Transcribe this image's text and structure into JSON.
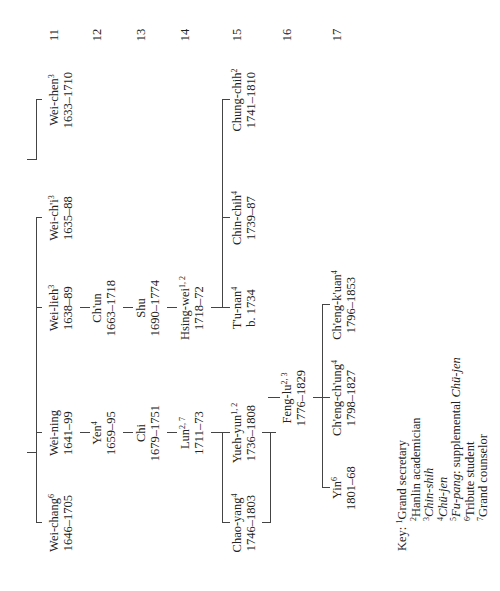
{
  "generations": [
    "11",
    "12",
    "13",
    "14",
    "15",
    "16",
    "17"
  ],
  "people": {
    "wei_chen": {
      "name": "Wei-chen",
      "sup": "3",
      "dates": "1633–1710"
    },
    "wei_chang": {
      "name": "Wei-chang",
      "sup": "6",
      "dates": "1646–1705"
    },
    "wei_ning": {
      "name": "Wei-ning",
      "sup": "",
      "dates": "1641–99"
    },
    "wei_lieh": {
      "name": "Wei-lieh",
      "sup": "3",
      "dates": "1638–89"
    },
    "wei_chi": {
      "name": "Wei-ch'i",
      "sup": "3",
      "dates": "1635–88"
    },
    "yen": {
      "name": "Yen",
      "sup": "4",
      "dates": "1659–95"
    },
    "chun": {
      "name": "Ch'un",
      "sup": "",
      "dates": "1663–1718"
    },
    "chi": {
      "name": "Chi",
      "sup": "",
      "dates": "1679–1751"
    },
    "shu": {
      "name": "Shu",
      "sup": "",
      "dates": "1690–1774"
    },
    "lun": {
      "name": "Lun",
      "sup": "2, 7",
      "dates": "1711–73"
    },
    "hsing_wei": {
      "name": "Hsing-wei",
      "sup": "1, 2",
      "dates": "1718–72"
    },
    "chao_yang": {
      "name": "Chao-yang",
      "sup": "4",
      "dates": "1746–1803"
    },
    "yueh_yun": {
      "name": "Yueh-yun",
      "sup": "1, 2",
      "dates": "1736–1808"
    },
    "tu_nan": {
      "name": "T'u-nan",
      "sup": "4",
      "dates": "b. 1734"
    },
    "chin_chih": {
      "name": "Chin-chih",
      "sup": "4",
      "dates": "1739–87"
    },
    "chung_chih": {
      "name": "Chung-chih",
      "sup": "2",
      "dates": "1741–1810"
    },
    "feng_lu": {
      "name": "Feng-lu",
      "sup": "2, 3",
      "dates": "1776–1829"
    },
    "yin": {
      "name": "Yin",
      "sup": "6",
      "dates": "1801–68"
    },
    "cheng_chung": {
      "name": "Ch'eng-ch'ung",
      "sup": "4",
      "dates": "1798–1827"
    },
    "cheng_kuan": {
      "name": "Ch'eng-k'uan",
      "sup": "4",
      "dates": "1796–1853"
    }
  },
  "key": {
    "label": "Key:",
    "items": [
      {
        "num": "1",
        "text": "Grand secretary",
        "italic": false
      },
      {
        "num": "2",
        "text": "Hanlin academician",
        "italic": false
      },
      {
        "num": "3",
        "text": "Chin-shih",
        "italic": true
      },
      {
        "num": "4",
        "text": "Chü-jen",
        "italic": true
      },
      {
        "num": "5",
        "text_italic": "Fu-pang",
        "text": ": supplemental ",
        "text_italic2": "Chü-jen"
      },
      {
        "num": "6",
        "text": "Tribute student",
        "italic": false
      },
      {
        "num": "7",
        "text": "Grand counselor",
        "italic": false
      }
    ]
  }
}
